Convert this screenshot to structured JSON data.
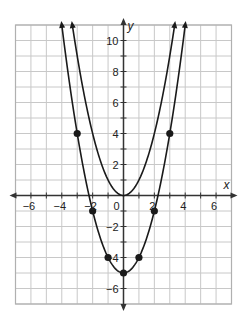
{
  "chart_data": {
    "type": "line",
    "title": "",
    "xlabel": "x",
    "ylabel": "y",
    "xlim": [
      -7,
      7
    ],
    "ylim": [
      -7,
      11
    ],
    "grid": true,
    "x_ticks": [
      -6,
      -4,
      -2,
      0,
      2,
      4,
      6
    ],
    "y_ticks": [
      -6,
      -4,
      -2,
      2,
      4,
      6,
      8,
      10
    ],
    "x_tick_labels": [
      "−6",
      "−4",
      "−2",
      "0",
      "2",
      "4",
      "6"
    ],
    "y_tick_labels": [
      "−6",
      "−4",
      "−2",
      "2",
      "4",
      "6",
      "8",
      "10"
    ],
    "series": [
      {
        "name": "y = x²",
        "equation": "x^2",
        "a": 1,
        "k": 0,
        "points": []
      },
      {
        "name": "y = x² − 5",
        "equation": "x^2 - 5",
        "a": 1,
        "k": -5,
        "points": [
          [
            -3,
            4
          ],
          [
            -2,
            -1
          ],
          [
            -1,
            -4
          ],
          [
            0,
            -5
          ],
          [
            1,
            -4
          ],
          [
            2,
            -1
          ],
          [
            3,
            4
          ]
        ]
      }
    ],
    "colors": {
      "curve": "#1a1a1a",
      "grid": "#c8c8c8",
      "axis": "#333333",
      "border": "#b0b0b0"
    }
  }
}
